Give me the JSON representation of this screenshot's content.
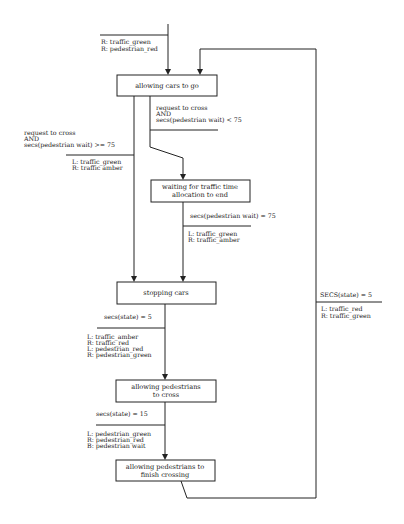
{
  "states": [
    {
      "id": "s1",
      "lines": [
        "allowing cars to go"
      ]
    },
    {
      "id": "s2",
      "lines": [
        "waiting for traffic time",
        "allocation to end"
      ]
    },
    {
      "id": "s3",
      "lines": [
        "stopping cars"
      ]
    },
    {
      "id": "s4",
      "lines": [
        "allowing pedestrians",
        "to cross"
      ]
    },
    {
      "id": "s5",
      "lines": [
        "allowing pedestrians to",
        "finish crossing"
      ]
    }
  ],
  "transitions": [
    {
      "id": "init",
      "to": "s1",
      "condition": [],
      "actions": [
        "R: traffic_green",
        "R: pedestrian_red"
      ]
    },
    {
      "id": "t1",
      "from": "s1",
      "to": "s2",
      "condition": [
        "request to cross",
        "AND",
        "secs(pedestrian wait) < 75"
      ],
      "actions": []
    },
    {
      "id": "t2",
      "from": "s1",
      "to": "s3",
      "condition": [
        "request to cross",
        "AND",
        "secs(pedestrian wait) >= 75"
      ],
      "actions": [
        "L: traffic_green",
        "R: traffic amber"
      ]
    },
    {
      "id": "t3",
      "from": "s2",
      "to": "s3",
      "condition": [
        "secs(pedestrian wait) = 75"
      ],
      "actions": [
        "L: traffic_green",
        "R: traffic_amber"
      ]
    },
    {
      "id": "t4",
      "from": "s3",
      "to": "s4",
      "condition": [
        "secs(state) = 5"
      ],
      "actions": [
        "L: traffic_amber",
        "R: traffic_red",
        "L: pedestrian_red",
        "R: pedestrian_green"
      ]
    },
    {
      "id": "t5",
      "from": "s4",
      "to": "s5",
      "condition": [
        "secs(state) = 15"
      ],
      "actions": [
        "L: pedestrian_green",
        "R: pedestrian_red",
        "B: pedestrian wait"
      ]
    },
    {
      "id": "t6",
      "from": "s5",
      "to": "s1",
      "condition": [
        "SECS(state) = 5"
      ],
      "actions": [
        "L: traffic_red",
        "R: traffic_green"
      ]
    }
  ]
}
